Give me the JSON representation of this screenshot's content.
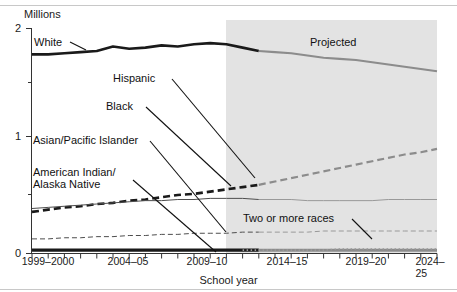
{
  "axes": {
    "ylabel": "Millions",
    "xlabel": "School year",
    "yticks": [
      "0",
      "1",
      "2"
    ],
    "xticks": [
      "1999–2000",
      "2004–05",
      "2009–10",
      "2014–15",
      "2019–20",
      "2024–25"
    ]
  },
  "annotations": {
    "projected": "Projected",
    "white": "White",
    "hispanic": "Hispanic",
    "black": "Black",
    "asian_pacific_islander": "Asian/Pacific Islander",
    "american_indian_line1": "American Indian/",
    "american_indian_line2": "Alaska Native",
    "two_or_more_races": "Two or more races"
  },
  "colors": {
    "line_dark": "#1a1a1a",
    "line_gray": "#8c8c8c",
    "projected_shade": "#e3e3e3",
    "axis": "#333333",
    "rule": "#c8c8c8"
  },
  "chart_data": {
    "type": "line",
    "title": "",
    "subtitle": "",
    "xlabel": "School year",
    "ylabel": "Millions",
    "xlim": [
      "1999–2000",
      "2024–25"
    ],
    "ylim": [
      0,
      2
    ],
    "yticks": [
      0,
      1,
      2
    ],
    "grid": false,
    "legend": "inline-labels",
    "projection_start": "2013–14",
    "projected_label": "Projected",
    "x": [
      "1999–2000",
      "2000–01",
      "2001–02",
      "2002–03",
      "2003–04",
      "2004–05",
      "2005–06",
      "2006–07",
      "2007–08",
      "2008–09",
      "2009–10",
      "2010–11",
      "2011–12",
      "2012–13",
      "2013–14",
      "2014–15",
      "2015–16",
      "2016–17",
      "2017–18",
      "2018–19",
      "2019–20",
      "2020–21",
      "2021–22",
      "2022–23",
      "2023–24",
      "2024–25"
    ],
    "series": [
      {
        "name": "White",
        "style": "solid-thick",
        "values": [
          1.77,
          1.77,
          1.78,
          1.79,
          1.8,
          1.84,
          1.82,
          1.83,
          1.85,
          1.84,
          1.86,
          1.87,
          1.86,
          1.83,
          1.8,
          1.79,
          1.78,
          1.76,
          1.74,
          1.73,
          1.72,
          1.7,
          1.68,
          1.66,
          1.64,
          1.62
        ]
      },
      {
        "name": "Hispanic",
        "style": "dashed-thick",
        "values": [
          0.37,
          0.39,
          0.41,
          0.42,
          0.44,
          0.45,
          0.47,
          0.48,
          0.5,
          0.52,
          0.53,
          0.55,
          0.57,
          0.59,
          0.61,
          0.64,
          0.67,
          0.7,
          0.73,
          0.76,
          0.79,
          0.82,
          0.85,
          0.88,
          0.9,
          0.93
        ]
      },
      {
        "name": "Black",
        "style": "solid-thin",
        "values": [
          0.4,
          0.41,
          0.42,
          0.43,
          0.44,
          0.45,
          0.46,
          0.47,
          0.47,
          0.48,
          0.48,
          0.49,
          0.49,
          0.49,
          0.48,
          0.48,
          0.48,
          0.47,
          0.47,
          0.47,
          0.47,
          0.47,
          0.48,
          0.48,
          0.48,
          0.48
        ]
      },
      {
        "name": "Asian/Pacific Islander",
        "style": "dashed-thin",
        "values": [
          0.13,
          0.13,
          0.14,
          0.14,
          0.15,
          0.15,
          0.16,
          0.16,
          0.17,
          0.17,
          0.18,
          0.18,
          0.18,
          0.19,
          0.19,
          0.19,
          0.19,
          0.19,
          0.2,
          0.2,
          0.2,
          0.2,
          0.2,
          0.2,
          0.2,
          0.2
        ]
      },
      {
        "name": "American Indian/Alaska Native",
        "style": "solid-verythick",
        "values": [
          0.03,
          0.03,
          0.03,
          0.03,
          0.03,
          0.03,
          0.03,
          0.03,
          0.03,
          0.03,
          0.03,
          0.03,
          0.03,
          0.03,
          0.03,
          0.03,
          0.03,
          0.03,
          0.03,
          0.03,
          0.03,
          0.03,
          0.03,
          0.03,
          0.03,
          0.03
        ]
      },
      {
        "name": "Two or more races",
        "style": "dotted",
        "values": [
          null,
          null,
          null,
          null,
          null,
          null,
          null,
          null,
          null,
          null,
          null,
          null,
          null,
          0.03,
          0.03,
          0.03,
          0.03,
          0.03,
          0.03,
          0.04,
          0.04,
          0.04,
          0.04,
          0.04,
          0.04,
          0.04
        ]
      }
    ]
  }
}
